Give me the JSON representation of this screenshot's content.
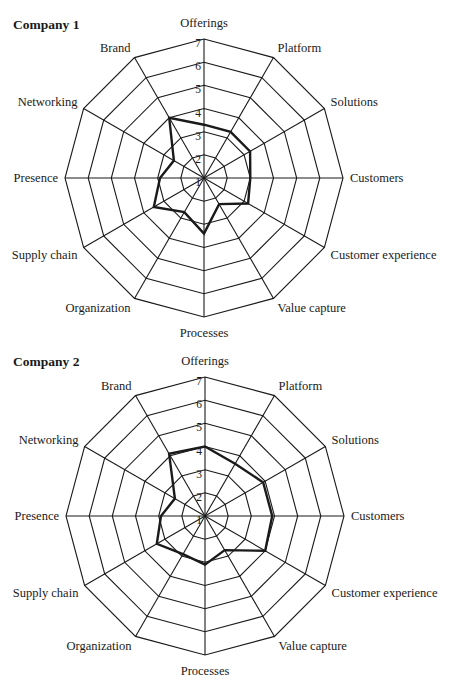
{
  "chart_data": [
    {
      "type": "radar",
      "title": "Company 1",
      "categories": [
        "Offerings",
        "Platform",
        "Solutions",
        "Customers",
        "Customer experience",
        "Value capture",
        "Processes",
        "Organization",
        "Supply chain",
        "Presence",
        "Networking",
        "Brand"
      ],
      "values": [
        3.3,
        3.3,
        3.3,
        3.0,
        3.2,
        2.3,
        3.4,
        2.7,
        3.5,
        2.9,
        2.5,
        4.0
      ],
      "rlim": [
        1,
        7
      ],
      "ticks": [
        1,
        2,
        3,
        4,
        5,
        6,
        7
      ],
      "grid": true,
      "legend": null
    },
    {
      "type": "radar",
      "title": "Company 2",
      "categories": [
        "Offerings",
        "Platform",
        "Solutions",
        "Customers",
        "Customer experience",
        "Value capture",
        "Processes",
        "Organization",
        "Supply chain",
        "Presence",
        "Networking",
        "Brand"
      ],
      "values": [
        4.0,
        3.6,
        3.9,
        3.9,
        4.0,
        2.7,
        3.1,
        2.9,
        3.4,
        2.9,
        2.5,
        4.1
      ],
      "rlim": [
        1,
        7
      ],
      "ticks": [
        1,
        2,
        3,
        4,
        5,
        6,
        7
      ],
      "grid": true,
      "legend": null
    }
  ],
  "panels": [
    {
      "title": "Company 1"
    },
    {
      "title": "Company 2"
    }
  ],
  "colors": {
    "grid": "#1a1a1a",
    "series": "#1a1a1a",
    "background": "#ffffff"
  }
}
